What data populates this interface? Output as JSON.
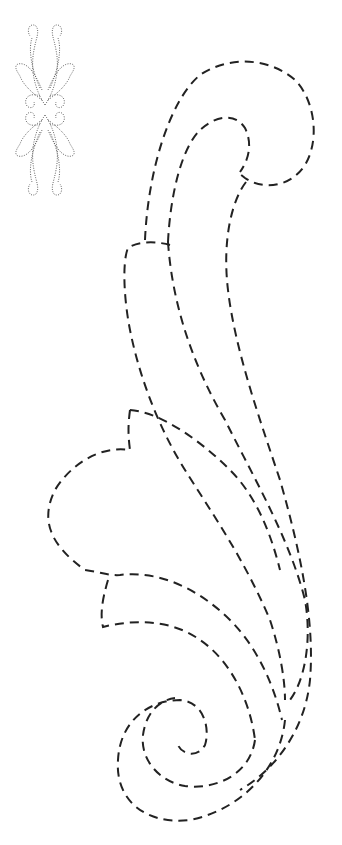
{
  "page": {
    "background": "#ffffff",
    "stroke_color": "#222222"
  },
  "thumbnail": {
    "description": "Dotted symmetrical ornament preview",
    "icon": "ornament-thumbnail-icon"
  },
  "pattern": {
    "description": "Large dashed acanthus scroll outline",
    "parts": [
      "outer-scroll-curl",
      "inner-scroll-curl",
      "upper-leaf",
      "middle-leaf",
      "lower-leaf",
      "bottom-spiral"
    ]
  },
  "footer": {
    "watermark": ""
  }
}
